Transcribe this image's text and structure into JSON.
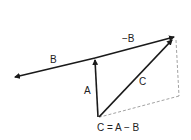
{
  "diagram": {
    "labels": {
      "b": "B",
      "neg_b": "−B",
      "a": "A",
      "c": "C",
      "caption": "C = A − B"
    },
    "colors": {
      "vector": "#1a1a1a",
      "dashed": "#8a8a8a",
      "text": "#222222"
    }
  }
}
